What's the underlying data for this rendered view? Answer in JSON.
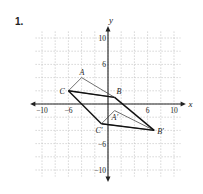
{
  "problem": {
    "number": "1."
  },
  "axes": {
    "x_label": "x",
    "y_label": "y",
    "x_ticks": [
      {
        "v": -10,
        "t": "−10"
      },
      {
        "v": -6,
        "t": "−6"
      },
      {
        "v": 6,
        "t": "6"
      },
      {
        "v": 10,
        "t": "10"
      }
    ],
    "y_ticks": [
      {
        "v": 10,
        "t": "10"
      },
      {
        "v": 6,
        "t": "6"
      },
      {
        "v": -6,
        "t": "−6"
      },
      {
        "v": -10,
        "t": "−10"
      }
    ]
  },
  "chart_data": {
    "type": "scatter",
    "title": "",
    "xlabel": "x",
    "ylabel": "y",
    "xlim": [
      -11,
      11
    ],
    "ylim": [
      -11,
      11
    ],
    "grid": true,
    "series": [
      {
        "name": "Triangle ABC",
        "points": {
          "A": [
            -4,
            4
          ],
          "B": [
            1,
            1
          ],
          "C": [
            -6,
            2
          ]
        }
      },
      {
        "name": "Triangle A'B'C'",
        "points": {
          "A'": [
            1,
            -1
          ],
          "B'": [
            7,
            -4
          ],
          "C'": [
            -1,
            -3
          ]
        }
      }
    ],
    "segments": [
      [
        "C",
        "B"
      ],
      [
        "C",
        "C'"
      ],
      [
        "B",
        "B'"
      ],
      [
        "C'",
        "B'"
      ]
    ]
  },
  "labels": {
    "A": "A",
    "B": "B",
    "C": "C",
    "A2": "A′",
    "B2": "B′",
    "C2": "C′"
  }
}
